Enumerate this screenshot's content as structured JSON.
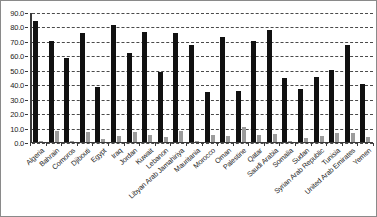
{
  "chart_data": {
    "type": "bar",
    "title": "",
    "subtitle": "",
    "xlabel": "",
    "ylabel": "",
    "ylim": [
      0.0,
      90.0
    ],
    "ytick_step": 10.0,
    "ytick_labels": [
      "0.0",
      "10.0",
      "20.0",
      "30.0",
      "40.0",
      "50.0",
      "60.0",
      "70.0",
      "80.0",
      "90.0"
    ],
    "grid": true,
    "grid_style": "dashed-horizontal",
    "legend": false,
    "legend_position": "none",
    "categories": [
      "Algeria",
      "Bahrain",
      "Comoros",
      "Djibouti",
      "Egypt",
      "Iraq",
      "Jordan",
      "Kuwait",
      "Lebanon",
      "Libyan Arab Jamahiriya",
      "Mauritania",
      "Morocco",
      "Oman",
      "Palestine",
      "Qatar",
      "Saudi Arabia",
      "Somalia",
      "Sudan",
      "Syrian Arab Republic",
      "Tunisia",
      "United Arab Emirates",
      "Yemen"
    ],
    "series": [
      {
        "name": "series-1",
        "color": "#111111",
        "values": [
          83.8,
          69.7,
          58.4,
          75.7,
          38.0,
          81.0,
          61.9,
          76.5,
          48.6,
          75.7,
          67.1,
          34.9,
          73.0,
          35.3,
          70.1,
          77.4,
          44.4,
          36.5,
          45.0,
          50.0,
          66.9,
          40.3
        ]
      },
      {
        "name": "series-2",
        "color": "#9c9c9c",
        "values": [
          0.9,
          7.3,
          0.5,
          6.6,
          1.8,
          4.0,
          6.7,
          4.9,
          3.2,
          7.3,
          0.6,
          4.6,
          4.2,
          10.5,
          4.8,
          5.3,
          0.5,
          2.9,
          3.9,
          6.4,
          6.3,
          3.8
        ]
      }
    ]
  }
}
